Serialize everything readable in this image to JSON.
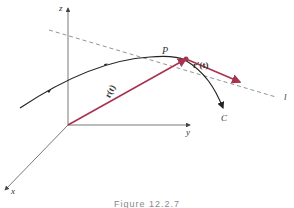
{
  "figure": {
    "caption": "Figure 12.2.7",
    "labels": {
      "z_axis": "z",
      "y_axis": "y",
      "x_axis": "x",
      "point": "P",
      "position_vector": "r(t)",
      "tangent_vector": "r′(t)",
      "curve": "C",
      "tangent_line": "l"
    },
    "colors": {
      "vector": "#a8334f",
      "curve": "#222222",
      "axis": "#555555",
      "dashed_line": "#777777"
    }
  }
}
